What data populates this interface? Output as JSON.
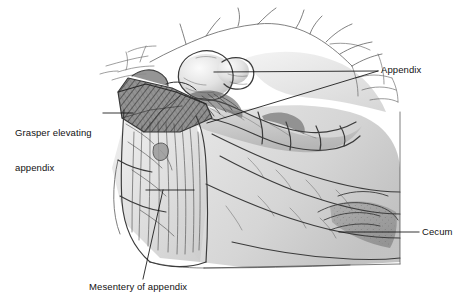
{
  "figure": {
    "kind": "medical-illustration",
    "style": "pen-and-ink line drawing with gray wash",
    "background_color": "#ffffff",
    "ink_color": "#3a3a3a",
    "wash_color": "#c9c9c9",
    "label_color": "#111111"
  },
  "labels": {
    "appendix": "Appendix",
    "grasper_line1": "Grasper elevating",
    "grasper_line2": "appendix",
    "cecum": "Cecum",
    "mesentery": "Mesentery of appendix"
  },
  "leaders": {
    "appendix_upper": "horizontal line from appendix tip to label convergence point",
    "appendix_lower": "diagonal line from appendix body to label convergence point",
    "grasper": "short horizontal line to grasper instrument",
    "cecum": "horizontal line to cecum wall",
    "mesentery": "bent line: horizontal segment then diagonal down to label"
  }
}
